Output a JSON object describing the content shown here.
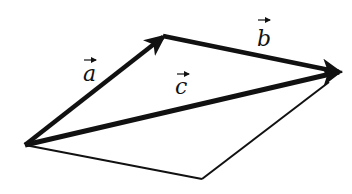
{
  "diagram": {
    "title": "",
    "colors": {
      "stroke": "#111111",
      "background": "#ffffff"
    },
    "points": {
      "O": [
        25,
        145
      ],
      "A": [
        165,
        35
      ],
      "B": [
        341,
        72
      ],
      "D": [
        202,
        179
      ]
    },
    "vectors": [
      {
        "name": "a",
        "label": "a",
        "from": "O",
        "to": "A",
        "style": "bold-arrow"
      },
      {
        "name": "b",
        "label": "b",
        "from": "A",
        "to": "B",
        "style": "bold-arrow"
      },
      {
        "name": "c",
        "label": "c",
        "from": "O",
        "to": "B",
        "style": "bold-arrow"
      }
    ],
    "edges": [
      {
        "from": "O",
        "to": "D",
        "style": "thin"
      },
      {
        "from": "D",
        "to": "B",
        "style": "thin"
      }
    ],
    "labels": {
      "a": "a",
      "b": "b",
      "c": "c"
    }
  }
}
